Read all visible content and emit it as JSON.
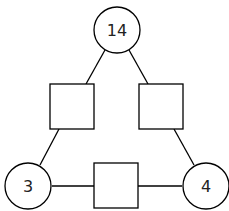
{
  "diagram": {
    "type": "number-triangle-puzzle",
    "circles": [
      {
        "id": "top",
        "value": "14",
        "cx": 117,
        "cy": 30
      },
      {
        "id": "bottom-left",
        "value": "3",
        "cx": 28,
        "cy": 186
      },
      {
        "id": "bottom-right",
        "value": "4",
        "cx": 206,
        "cy": 186
      }
    ],
    "squares": [
      {
        "id": "left",
        "value": "",
        "x": 50,
        "y": 84
      },
      {
        "id": "right",
        "value": "",
        "x": 139,
        "y": 84
      },
      {
        "id": "bottom",
        "value": "",
        "x": 94,
        "y": 163
      }
    ],
    "colors": {
      "stroke": "#000000",
      "fill": "#ffffff",
      "text": "#222222"
    }
  }
}
